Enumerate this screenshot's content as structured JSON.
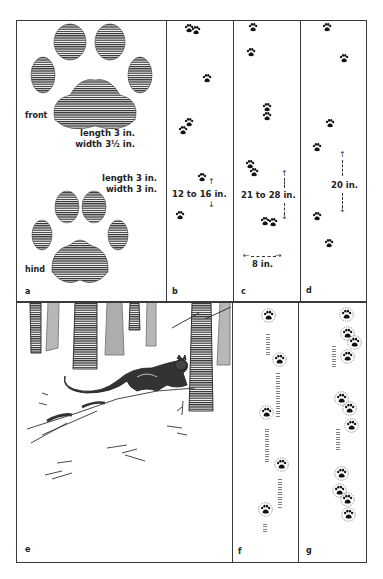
{
  "panels": {
    "a": {
      "letter": "a",
      "front": {
        "label": "front",
        "length": "length 3 in.",
        "width": "width 3½ in."
      },
      "hind": {
        "label": "hind",
        "length": "length 3 in.",
        "width": "width 3 in."
      }
    },
    "b": {
      "letter": "b",
      "measure": "12 to 16 in."
    },
    "c": {
      "letter": "c",
      "measure": "21 to 28 in.",
      "straddle": "8 in."
    },
    "d": {
      "letter": "d",
      "measure": "20 in."
    },
    "e": {
      "letter": "e",
      "scene": "cat walking through snowy forest"
    },
    "f": {
      "letter": "f"
    },
    "g": {
      "letter": "g"
    }
  },
  "icons": {
    "track": "paw-print-icon",
    "arrow_up": "↑",
    "arrow_down": "↓",
    "arrow_left": "←",
    "arrow_right": "→"
  }
}
